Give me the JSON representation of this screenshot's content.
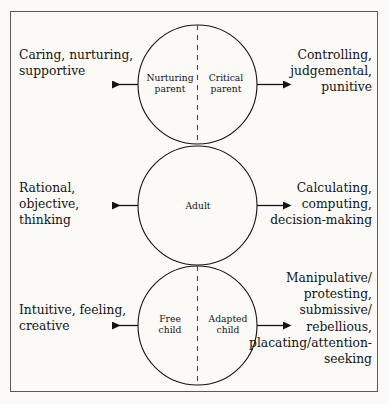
{
  "diagram": {
    "type": "transactional-analysis-ego-states",
    "frame": {
      "border_color": "#5a5a5a"
    },
    "background_color": "#fbfaf7",
    "stroke_color": "#1a1a1a",
    "ego_states": [
      {
        "id": "parent",
        "circle_label_left": "Nurturing\nparent",
        "circle_label_right": "Critical\nparent",
        "divided": true,
        "left_text": "Caring, nurturing,\nsupportive",
        "right_text": "Controlling,\njudgemental,\npunitive"
      },
      {
        "id": "adult",
        "circle_label_center": "Adult",
        "divided": false,
        "left_text": "Rational, objective,\nthinking",
        "right_text": "Calculating,\ncomputing,\ndecision-making"
      },
      {
        "id": "child",
        "circle_label_left": "Free\nchild",
        "circle_label_right": "Adapted\nchild",
        "divided": true,
        "left_text": "Intuitive, feeling,\ncreative",
        "right_text": "Manipulative/\nprotesting,\nsubmissive/\nrebellious,\nplacating/attention-\nseeking"
      }
    ],
    "arrows": {
      "left_direction": "left",
      "right_direction": "right",
      "count": 6
    }
  }
}
